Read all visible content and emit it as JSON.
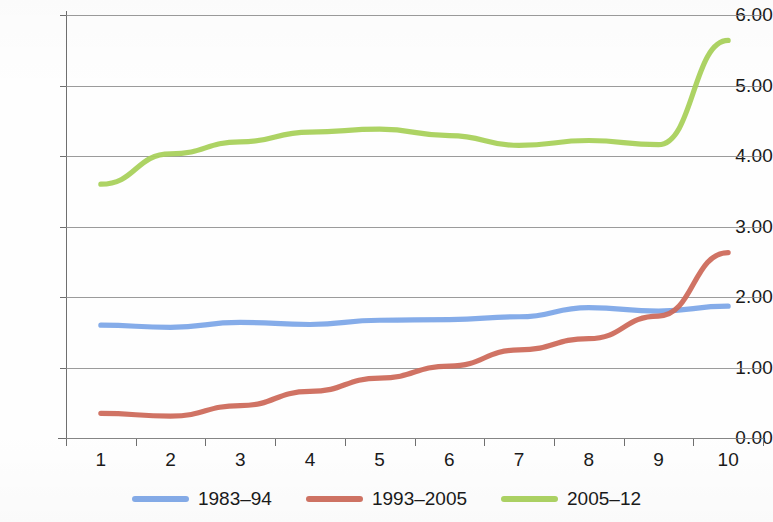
{
  "chart_data": {
    "type": "line",
    "title": "",
    "subtitle": "",
    "xlabel": "",
    "ylabel": "",
    "categories": [
      "1",
      "2",
      "3",
      "4",
      "5",
      "6",
      "7",
      "8",
      "9",
      "10"
    ],
    "ylim": [
      0,
      6
    ],
    "ytick_labels": [
      "0.00",
      "1.00",
      "2.00",
      "3.00",
      "4.00",
      "5.00",
      "6.00"
    ],
    "ytick_values": [
      0,
      1,
      2,
      3,
      4,
      5,
      6
    ],
    "grid": "horizontal",
    "legend_position": "bottom",
    "series": [
      {
        "name": "1983–94",
        "color": "#7da7e8",
        "values": [
          1.6,
          1.57,
          1.64,
          1.61,
          1.67,
          1.68,
          1.72,
          1.85,
          1.8,
          1.87
        ]
      },
      {
        "name": "1993–2005",
        "color": "#cd6a5a",
        "values": [
          0.35,
          0.31,
          0.46,
          0.66,
          0.85,
          1.02,
          1.25,
          1.41,
          1.73,
          2.63
        ]
      },
      {
        "name": "2005–12",
        "color": "#a8d05a",
        "values": [
          3.6,
          4.03,
          4.2,
          4.34,
          4.38,
          4.29,
          4.15,
          4.22,
          4.16,
          5.64
        ]
      }
    ]
  },
  "axes": {
    "y_labels": [
      "6.00",
      "5.00",
      "4.00",
      "3.00",
      "2.00",
      "1.00",
      "0.00"
    ],
    "x_labels": [
      "1",
      "2",
      "3",
      "4",
      "5",
      "6",
      "7",
      "8",
      "9",
      "10"
    ]
  },
  "legend": {
    "items": [
      {
        "label": "1983–94",
        "color": "#7da7e8"
      },
      {
        "label": "1993–2005",
        "color": "#cd6a5a"
      },
      {
        "label": "2005–12",
        "color": "#a8d05a"
      }
    ]
  },
  "colors": {
    "series_blue": "#7da7e8",
    "series_red": "#cd6a5a",
    "series_green": "#a8d05a",
    "gridline": "#8a8a8a",
    "axis": "#6f6f6f",
    "text": "#1a1a1a",
    "background": "#fefefe"
  }
}
